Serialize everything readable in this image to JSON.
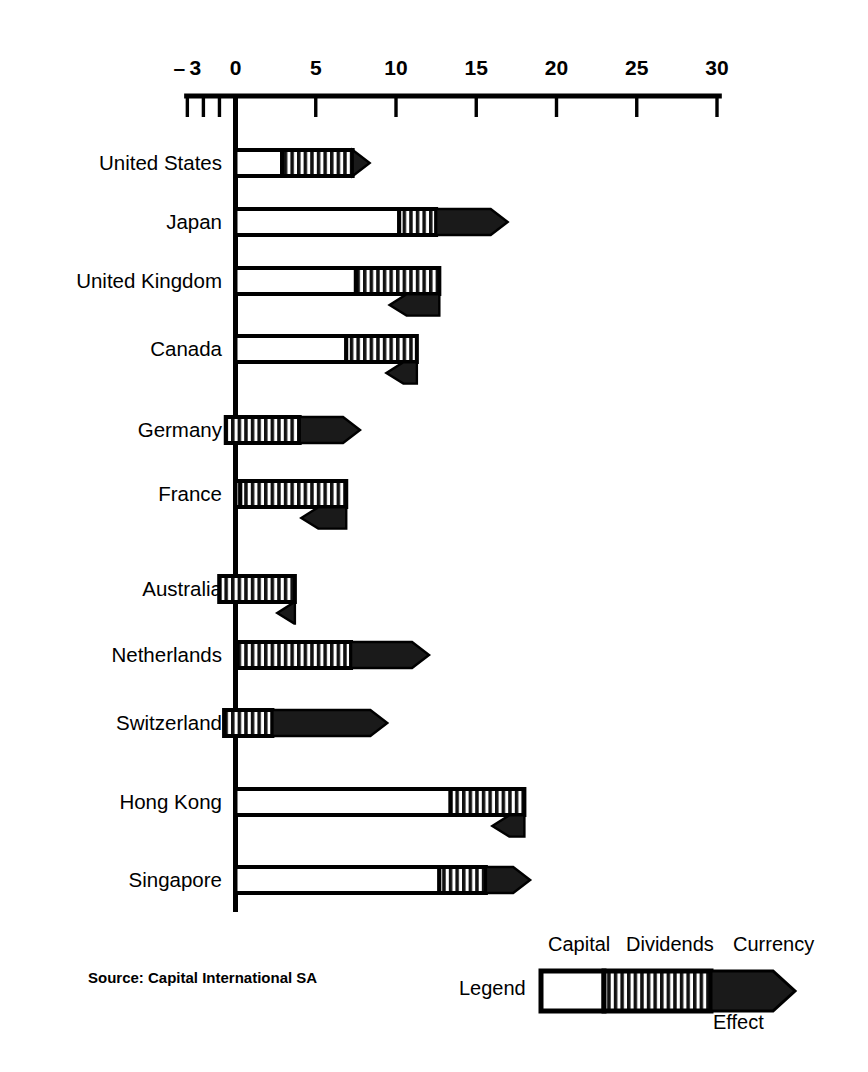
{
  "chart_data": {
    "type": "bar",
    "orientation": "horizontal",
    "title": "",
    "subtitle": "",
    "xlabel": "",
    "ylabel": "",
    "xlim": [
      -3,
      30
    ],
    "xticks": [
      -3,
      -2,
      -1,
      0,
      5,
      10,
      15,
      20,
      25,
      30
    ],
    "xticklabels": [
      "-3",
      "",
      "",
      "0",
      "5",
      "10",
      "15",
      "20",
      "25",
      "30"
    ],
    "grid": false,
    "legend_position": "bottom-right",
    "stacked": true,
    "series": [
      {
        "name": "Capital",
        "style": "white",
        "values": [
          2.9,
          10.2,
          7.5,
          6.9,
          -0.6,
          0.3,
          -1.0,
          0.1,
          -0.7,
          13.4,
          12.7
        ]
      },
      {
        "name": "Dividends",
        "style": "hatched",
        "values": [
          4.4,
          2.3,
          5.2,
          4.4,
          4.6,
          6.6,
          4.7,
          7.1,
          3.0,
          4.6,
          2.9
        ]
      },
      {
        "name": "Currency Effect",
        "style": "black-arrow",
        "values": [
          0.9,
          4.3,
          -3.1,
          -1.9,
          3.6,
          -2.8,
          -1.1,
          4.7,
          7.0,
          -2.0,
          2.6
        ]
      }
    ],
    "categories": [
      "United States",
      "Japan",
      "United Kingdom",
      "Canada",
      "Germany",
      "France",
      "Australia",
      "Netherlands",
      "Switzerland",
      "Hong Kong",
      "Singapore"
    ],
    "totals": [
      8.2,
      16.8,
      9.6,
      9.4,
      7.6,
      4.1,
      2.6,
      11.9,
      9.3,
      16.0,
      18.2
    ],
    "annotations": {
      "source": "Source: Capital International SA",
      "legend_title": "Legend",
      "legend_items": [
        "Capital",
        "Dividends",
        "Currency",
        "Effect"
      ]
    }
  },
  "axis": {
    "ticks": [
      {
        "value": -3,
        "label": "-3"
      },
      {
        "value": -2,
        "label": ""
      },
      {
        "value": -1,
        "label": ""
      },
      {
        "value": 0,
        "label": "0"
      },
      {
        "value": 5,
        "label": "5"
      },
      {
        "value": 10,
        "label": "10"
      },
      {
        "value": 15,
        "label": "15"
      },
      {
        "value": 20,
        "label": "20"
      },
      {
        "value": 25,
        "label": "25"
      },
      {
        "value": 30,
        "label": "30"
      }
    ]
  },
  "categories": [
    {
      "label": "United States"
    },
    {
      "label": "Japan"
    },
    {
      "label": "United Kingdom"
    },
    {
      "label": "Canada"
    },
    {
      "label": "Germany"
    },
    {
      "label": "France"
    },
    {
      "label": "Australia"
    },
    {
      "label": "Netherlands"
    },
    {
      "label": "Switzerland"
    },
    {
      "label": "Hong Kong"
    },
    {
      "label": "Singapore"
    }
  ],
  "footer": {
    "source": "Source: Capital International SA"
  },
  "legend": {
    "label": "Legend",
    "capital": "Capital",
    "dividends": "Dividends",
    "currency": "Currency",
    "effect": "Effect"
  },
  "colors": {
    "ink": "#000000",
    "background": "#ffffff",
    "capital_fill": "#ffffff",
    "dividends_fill": "#ffffff",
    "currency_fill": "#1a1a1a"
  }
}
